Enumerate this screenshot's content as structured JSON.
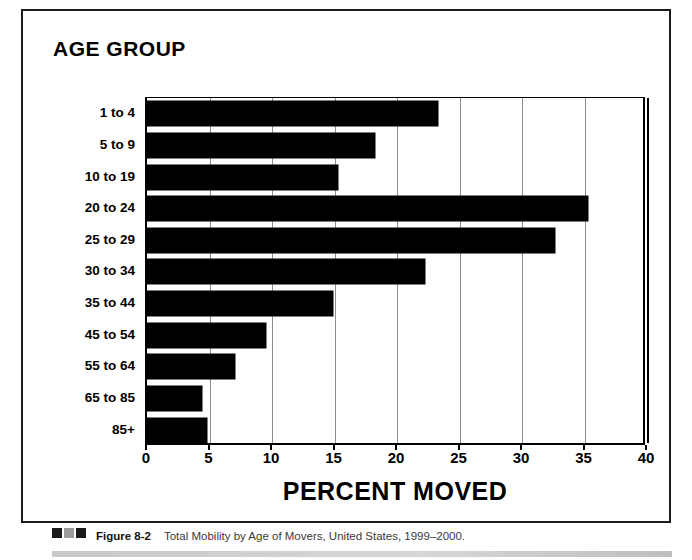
{
  "figure": {
    "age_group_heading": "AGE GROUP",
    "caption_figure_number": "Figure 8-2",
    "caption_text": "Total Mobility by Age of Movers, United States, 1999–2000.",
    "colors": {
      "bar_fill": "#000000",
      "axis": "#000000",
      "gridline": "#8d8d8d",
      "frame": "#1a1a1a",
      "caption_text": "#3a3a3a"
    }
  },
  "chart_data": {
    "type": "bar",
    "orientation": "horizontal",
    "title": "",
    "subtitle": "",
    "xlabel": "PERCENT MOVED",
    "ylabel": "AGE GROUP",
    "xlim": [
      0,
      40
    ],
    "xticks": [
      0,
      5,
      10,
      15,
      20,
      25,
      30,
      35,
      40
    ],
    "xtick_labels": [
      "0",
      "5",
      "10",
      "15",
      "20",
      "25",
      "30",
      "35",
      "40"
    ],
    "grid": "vertical",
    "legend": "none",
    "categories": [
      "1 to 4",
      "5 to 9",
      "10 to 19",
      "20 to 24",
      "25 to 29",
      "30 to 34",
      "35 to 44",
      "45 to 54",
      "55 to 64",
      "65 to 85",
      "85+"
    ],
    "values": [
      23.3,
      18.2,
      15.3,
      35.3,
      32.6,
      22.2,
      14.9,
      9.5,
      7.0,
      4.4,
      4.8
    ],
    "series": [
      {
        "name": "Percent moved",
        "values": [
          23.3,
          18.2,
          15.3,
          35.3,
          32.6,
          22.2,
          14.9,
          9.5,
          7.0,
          4.4,
          4.8
        ]
      }
    ]
  }
}
